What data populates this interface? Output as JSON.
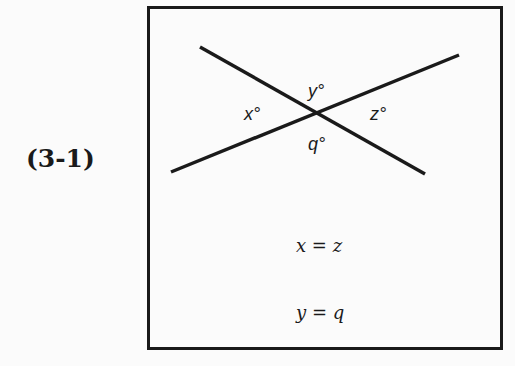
{
  "figure": {
    "label": "(3-1)",
    "angles": {
      "top": "y°",
      "left": "x°",
      "right": "z°",
      "bottom": "q°"
    },
    "equations": [
      "x = z",
      "y = q"
    ],
    "colors": {
      "ink": "#1a1a1a",
      "background": "#fbfbfb"
    }
  }
}
